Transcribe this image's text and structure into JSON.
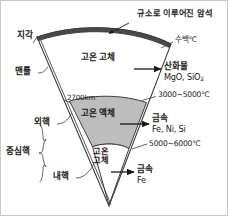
{
  "figure": {
    "type": "cross-section-wedge-diagram",
    "colors": {
      "crust_fill": "#4a4a4a",
      "mantle_fill": "#ffffff",
      "outer_core_fill": "#bdbdbd",
      "inner_core_fill": "#ffffff",
      "stroke": "#3c3c3c",
      "text": "#1a1a1a",
      "background": "#ffffff"
    }
  },
  "callouts": {
    "top_rock": "규소로 이루어진 암석"
  },
  "layers_left": [
    {
      "name": "crust",
      "label": "지각"
    },
    {
      "name": "mantle",
      "label": "맨틀"
    },
    {
      "name": "outer-core",
      "label": "외핵"
    },
    {
      "name": "central-core",
      "label": "중심핵"
    },
    {
      "name": "inner-core",
      "label": "내핵"
    }
  ],
  "interior_labels": [
    {
      "name": "mantle-state",
      "text": "고온 고체"
    },
    {
      "name": "outer-core-state",
      "text": "고온 액체"
    },
    {
      "name": "inner-core-state-line1",
      "text": "고온"
    },
    {
      "name": "inner-core-state-line2",
      "text": "고체"
    }
  ],
  "depth_markers": [
    {
      "name": "mantle-core-boundary-depth",
      "value": "2700km"
    }
  ],
  "temperatures": [
    {
      "name": "crust-temp",
      "value": "수백℃"
    },
    {
      "name": "mantle-core-temp",
      "value": "3000~5000℃"
    },
    {
      "name": "outer-inner-core-temp",
      "value": "5000~6000℃"
    }
  ],
  "compositions": [
    {
      "name": "mantle-composition",
      "title": "산화물",
      "formula_1": "MgO",
      "formula_1_sub": "",
      "formula_line": "MgO, SiO",
      "formula_sub": "2"
    },
    {
      "name": "outer-core-composition",
      "title": "금속",
      "formula_line": "Fe, Ni, Si",
      "formula_sub": ""
    },
    {
      "name": "inner-core-composition",
      "title": "금속",
      "formula_line": "Fe",
      "formula_sub": ""
    }
  ]
}
